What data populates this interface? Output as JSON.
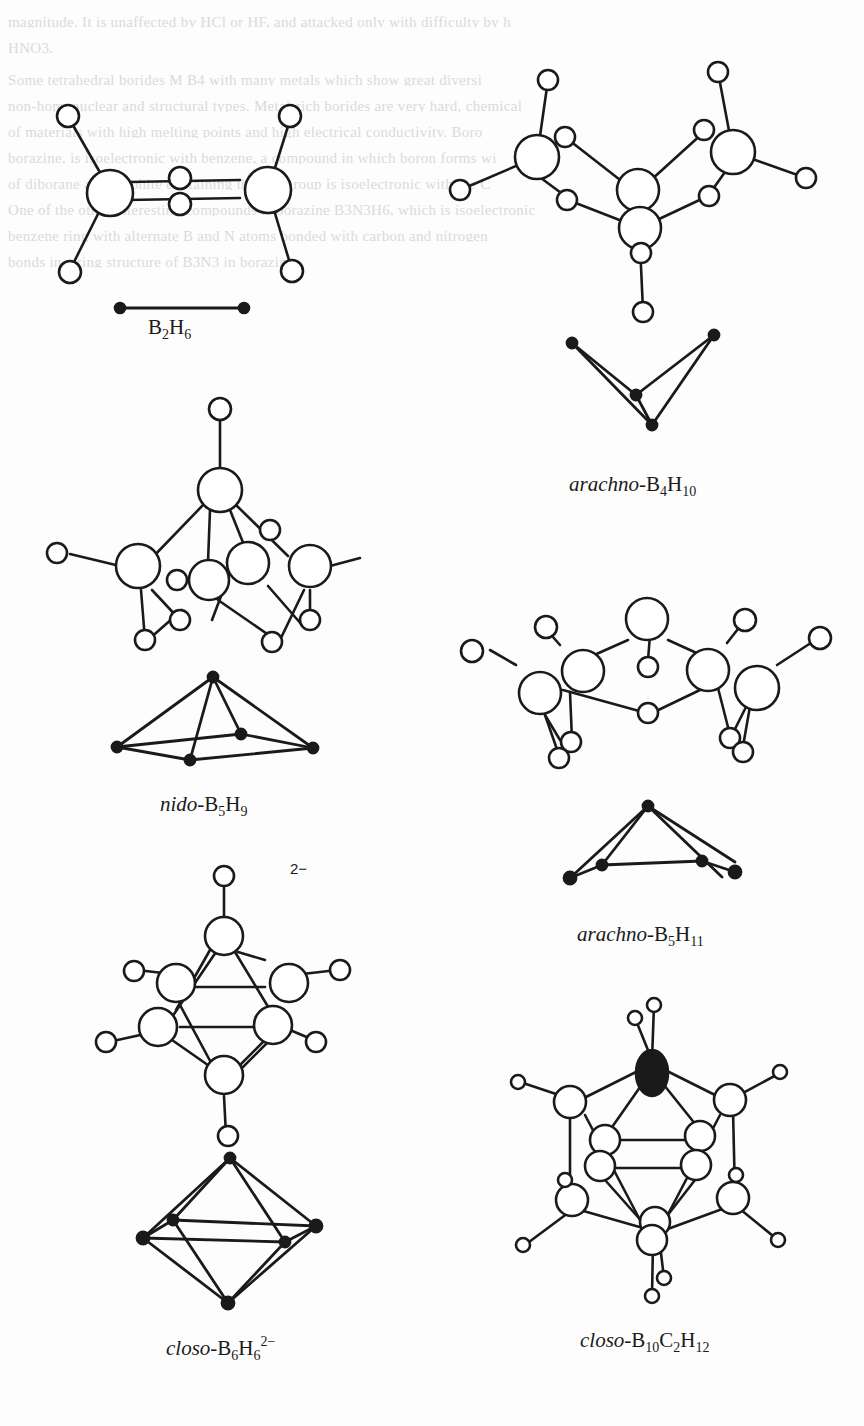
{
  "page": {
    "type": "scanned textbook figure",
    "bleed_through_text": [
      "magnitude. It is unaffected by HCl or HF, and attacked only with difficulty by h",
      "HNO3.",
      "Some tetrahedral borides M B4 with many metals which show great diversi",
      "non-homonuclear and structural types. Metal-rich borides are very hard, chemical",
      "of materials with high melting points and high electrical conductivity. Boro",
      "borazine, is isoelectronic with benzene, a compound in which boron forms wi",
      "of diborane and graphite containing the BN group is isoelectronic with the C",
      "One of the other interesting compounds is borazine B3N3H6, which is isoelectronic",
      "benzene ring with alternate B and N atoms bonded with carbon and nitrogen",
      "bonds in a ring structure of B3N3 in borazine."
    ]
  },
  "molecules": [
    {
      "id": "b2h6",
      "label": {
        "prefix": "",
        "parts": [
          [
            "B",
            "2"
          ],
          [
            "H",
            "6"
          ]
        ],
        "charge": ""
      },
      "label_pos": [
        148,
        315
      ]
    },
    {
      "id": "arachno-b4h10",
      "label": {
        "prefix": "arachno-",
        "parts": [
          [
            "B",
            "4"
          ],
          [
            "H",
            "10"
          ]
        ],
        "charge": ""
      },
      "label_pos": [
        568,
        478
      ]
    },
    {
      "id": "nido-b5h9",
      "label": {
        "prefix": "nido-",
        "parts": [
          [
            "B",
            "5"
          ],
          [
            "H",
            "9"
          ]
        ],
        "charge": ""
      },
      "label_pos": [
        160,
        800
      ]
    },
    {
      "id": "arachno-b5h11",
      "label": {
        "prefix": "arachno-",
        "parts": [
          [
            "B",
            "5"
          ],
          [
            "H",
            "11"
          ]
        ],
        "charge": ""
      },
      "label_pos": [
        577,
        930
      ]
    },
    {
      "id": "closo-b6h6",
      "label": {
        "prefix": "closo-",
        "parts": [
          [
            "B",
            "6"
          ],
          [
            "H",
            "6"
          ]
        ],
        "charge": "2−"
      },
      "label_pos": [
        165,
        1345
      ],
      "ion_charge_label": "2−",
      "ion_charge_pos": [
        290,
        860
      ]
    },
    {
      "id": "closo-b10c2h12",
      "label": {
        "prefix": "closo-",
        "parts": [
          [
            "B",
            "10"
          ],
          [
            "C",
            "2"
          ],
          [
            "H",
            "12"
          ]
        ],
        "charge": ""
      },
      "label_pos": [
        577,
        1334
      ]
    }
  ],
  "labels": {
    "b2h6": "B2H6",
    "arachno_b4h10": "arachno-B4H10",
    "nido_b5h9": "nido-B5H9",
    "arachno_b5h11": "arachno-B5H11",
    "closo_b6h6": "closo-B6H6 2−",
    "closo_b10c2h12": "closo-B10C2H12",
    "charge_2minus": "2−"
  },
  "colors": {
    "ink": "#1a1a1a",
    "paper": "#fdfdfd",
    "bleed": "#dadada"
  }
}
